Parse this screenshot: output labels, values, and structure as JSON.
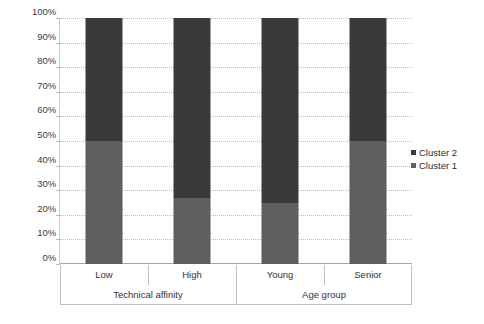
{
  "chart_data": {
    "type": "bar",
    "subtype": "100% stacked column",
    "title": "",
    "xlabel": "",
    "ylabel": "",
    "categories": [
      "Low",
      "High",
      "Young",
      "Senior"
    ],
    "group_axis": [
      {
        "label": "Technical affinity",
        "categories": [
          "Low",
          "High"
        ]
      },
      {
        "label": "Age group",
        "categories": [
          "Young",
          "Senior"
        ]
      }
    ],
    "series": [
      {
        "name": "Cluster 1",
        "color": "#5e5e5e",
        "values": [
          50,
          27,
          25,
          50
        ]
      },
      {
        "name": "Cluster 2",
        "color": "#3a3a3a",
        "values": [
          50,
          73,
          75,
          50
        ]
      }
    ],
    "stack_order_bottom_to_top": [
      "Cluster 1",
      "Cluster 2"
    ],
    "ylim": [
      0,
      100
    ],
    "ytick_values": [
      0,
      10,
      20,
      30,
      40,
      50,
      60,
      70,
      80,
      90,
      100
    ],
    "ytick_labels": [
      "0%",
      "10%",
      "20%",
      "30%",
      "40%",
      "50%",
      "60%",
      "70%",
      "80%",
      "90%",
      "100%"
    ],
    "grid": true,
    "grid_style": "dotted",
    "legend_position": "right",
    "legend_entries": [
      "Cluster 2",
      "Cluster 1"
    ]
  },
  "axis": {
    "y_labels": [
      "100%",
      "90%",
      "80%",
      "70%",
      "60%",
      "50%",
      "40%",
      "30%",
      "20%",
      "10%",
      "0%"
    ],
    "x_categories": [
      "Low",
      "High",
      "Young",
      "Senior"
    ],
    "x_groups": [
      "Technical affinity",
      "Age group"
    ]
  },
  "legend": {
    "items": [
      {
        "label": "Cluster 2",
        "color": "#3a3a3a"
      },
      {
        "label": "Cluster 1",
        "color": "#5e5e5e"
      }
    ]
  },
  "colors": {
    "cluster1": "#5e5e5e",
    "cluster2": "#3a3a3a",
    "gridline": "#bdbdbd",
    "axis": "#bfbfbf",
    "text": "#2b2b2b",
    "background": "#ffffff"
  }
}
